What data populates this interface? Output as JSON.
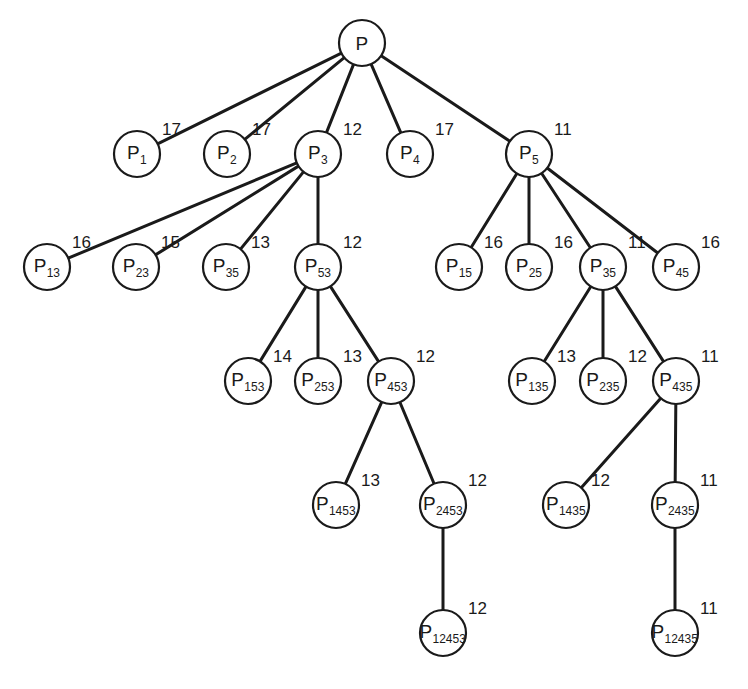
{
  "diagram": {
    "type": "tree",
    "node_radius": 23,
    "nodes": [
      {
        "id": "P",
        "base": "P",
        "sub": "",
        "cost": "",
        "x": 362,
        "y": 43
      },
      {
        "id": "P1",
        "base": "P",
        "sub": "1",
        "cost": "17",
        "x": 137,
        "y": 154
      },
      {
        "id": "P2",
        "base": "P",
        "sub": "2",
        "cost": "17",
        "x": 227,
        "y": 154
      },
      {
        "id": "P3",
        "base": "P",
        "sub": "3",
        "cost": "12",
        "x": 318,
        "y": 154
      },
      {
        "id": "P4",
        "base": "P",
        "sub": "4",
        "cost": "17",
        "x": 410,
        "y": 154
      },
      {
        "id": "P5",
        "base": "P",
        "sub": "5",
        "cost": "11",
        "x": 529,
        "y": 154
      },
      {
        "id": "P13",
        "base": "P",
        "sub": "13",
        "cost": "16",
        "x": 47,
        "y": 267
      },
      {
        "id": "P23",
        "base": "P",
        "sub": "23",
        "cost": "15",
        "x": 136,
        "y": 267
      },
      {
        "id": "P35a",
        "base": "P",
        "sub": "35",
        "cost": "13",
        "x": 226,
        "y": 267
      },
      {
        "id": "P53",
        "base": "P",
        "sub": "53",
        "cost": "12",
        "x": 318,
        "y": 267
      },
      {
        "id": "P15",
        "base": "P",
        "sub": "15",
        "cost": "16",
        "x": 459,
        "y": 267
      },
      {
        "id": "P25",
        "base": "P",
        "sub": "25",
        "cost": "16",
        "x": 529,
        "y": 267
      },
      {
        "id": "P35b",
        "base": "P",
        "sub": "35",
        "cost": "11",
        "x": 603,
        "y": 267
      },
      {
        "id": "P45",
        "base": "P",
        "sub": "45",
        "cost": "16",
        "x": 676,
        "y": 267
      },
      {
        "id": "P153",
        "base": "P",
        "sub": "153",
        "cost": "14",
        "x": 248,
        "y": 381
      },
      {
        "id": "P253",
        "base": "P",
        "sub": "253",
        "cost": "13",
        "x": 318,
        "y": 381
      },
      {
        "id": "P453",
        "base": "P",
        "sub": "453",
        "cost": "12",
        "x": 391,
        "y": 381
      },
      {
        "id": "P135",
        "base": "P",
        "sub": "135",
        "cost": "13",
        "x": 532,
        "y": 381
      },
      {
        "id": "P235",
        "base": "P",
        "sub": "235",
        "cost": "12",
        "x": 603,
        "y": 381
      },
      {
        "id": "P435",
        "base": "P",
        "sub": "435",
        "cost": "11",
        "x": 676,
        "y": 381
      },
      {
        "id": "P1453",
        "base": "P",
        "sub": "1453",
        "cost": "13",
        "x": 336,
        "y": 505
      },
      {
        "id": "P2453",
        "base": "P",
        "sub": "2453",
        "cost": "12",
        "x": 443,
        "y": 505
      },
      {
        "id": "P1435",
        "base": "P",
        "sub": "1435",
        "cost": "12",
        "x": 566,
        "y": 505
      },
      {
        "id": "P2435",
        "base": "P",
        "sub": "2435",
        "cost": "11",
        "x": 675,
        "y": 505
      },
      {
        "id": "P12453",
        "base": "P",
        "sub": "12453",
        "cost": "12",
        "x": 443,
        "y": 633
      },
      {
        "id": "P12435",
        "base": "P",
        "sub": "12435",
        "cost": "11",
        "x": 675,
        "y": 633
      }
    ],
    "edges": [
      [
        "P",
        "P1"
      ],
      [
        "P",
        "P2"
      ],
      [
        "P",
        "P3"
      ],
      [
        "P",
        "P4"
      ],
      [
        "P",
        "P5"
      ],
      [
        "P3",
        "P13"
      ],
      [
        "P3",
        "P23"
      ],
      [
        "P3",
        "P35a"
      ],
      [
        "P3",
        "P53"
      ],
      [
        "P5",
        "P15"
      ],
      [
        "P5",
        "P25"
      ],
      [
        "P5",
        "P35b"
      ],
      [
        "P5",
        "P45"
      ],
      [
        "P53",
        "P153"
      ],
      [
        "P53",
        "P253"
      ],
      [
        "P53",
        "P453"
      ],
      [
        "P35b",
        "P135"
      ],
      [
        "P35b",
        "P235"
      ],
      [
        "P35b",
        "P435"
      ],
      [
        "P453",
        "P1453"
      ],
      [
        "P453",
        "P2453"
      ],
      [
        "P435",
        "P1435"
      ],
      [
        "P435",
        "P2435"
      ],
      [
        "P2453",
        "P12453"
      ],
      [
        "P2435",
        "P12435"
      ]
    ]
  }
}
